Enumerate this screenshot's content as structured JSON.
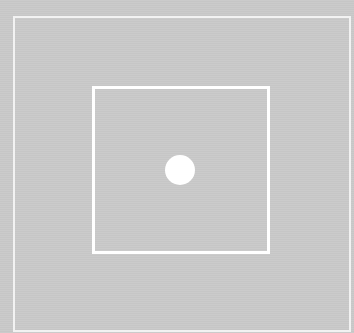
{
  "scene": {
    "background_color": "#c9c9c9",
    "outer_frame": {
      "color": "#f2f2f2",
      "x": 13,
      "y": 16,
      "width": 336,
      "height": 314
    },
    "inner_square": {
      "color": "#ffffff",
      "x": 92,
      "y": 86,
      "width": 178,
      "height": 168
    },
    "dot": {
      "color": "#ffffff",
      "center_x": 180,
      "center_y": 170,
      "radius": 15
    }
  }
}
